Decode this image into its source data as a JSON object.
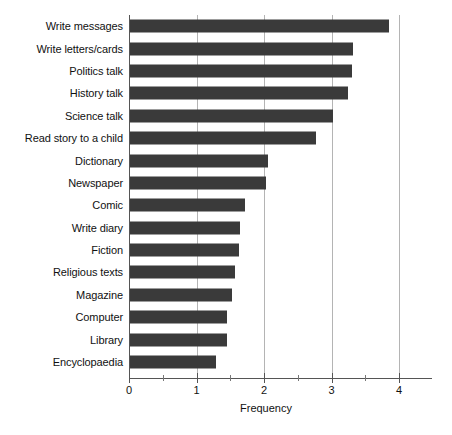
{
  "chart_data": {
    "type": "bar",
    "orientation": "horizontal",
    "title": "",
    "xlabel": "Frequency",
    "ylabel": "",
    "xlim": [
      0,
      4.49
    ],
    "ylim": null,
    "grid": "vertical-major",
    "legend": "none",
    "bar_color": "#3a3a3a",
    "categories": [
      "Write messages",
      "Write letters/cards",
      "Politics talk",
      "History talk",
      "Science talk",
      "Read story to a child",
      "Dictionary",
      "Newspaper",
      "Comic",
      "Write diary",
      "Fiction",
      "Religious texts",
      "Magazine",
      "Computer",
      "Library",
      "Encyclopaedia"
    ],
    "values": [
      3.84,
      3.3,
      3.29,
      3.23,
      3.0,
      2.76,
      2.04,
      2.02,
      1.7,
      1.63,
      1.62,
      1.56,
      1.51,
      1.44,
      1.43,
      1.27
    ],
    "xticks": [
      0,
      1,
      2,
      3,
      4
    ],
    "xtick_labels": [
      "0",
      "1",
      "2",
      "3",
      "4"
    ],
    "xminor_ticks": [
      0.5,
      1.5,
      2.5,
      3.5,
      4.5
    ]
  }
}
